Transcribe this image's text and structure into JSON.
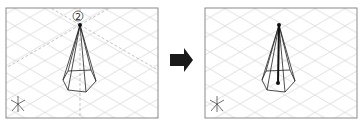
{
  "figure": {
    "panels": [
      {
        "id": "before",
        "marker_label": "2",
        "ucs_axes": [
          "X",
          "Y",
          "Z"
        ],
        "shows_dashed_tracking_lines": true,
        "shows_center_line": false
      },
      {
        "id": "after",
        "ucs_axes": [
          "X",
          "Y",
          "Z"
        ],
        "shows_dashed_tracking_lines": false,
        "shows_center_line": true
      }
    ],
    "arrow": {
      "direction": "right",
      "color": "#1a1a1a"
    },
    "colors": {
      "frame_border": "#8a8a8a",
      "grid": "#d4d4d4",
      "wireframe": "#222222",
      "tracking": "#9a9a9a",
      "background": "#ffffff"
    }
  }
}
